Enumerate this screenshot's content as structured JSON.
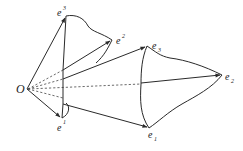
{
  "diagram": {
    "type": "vector-basis-frame",
    "colors": {
      "ink": "#2a2a2a",
      "background": "#ffffff"
    },
    "origin": {
      "label": "O",
      "x": 27,
      "y": 89
    },
    "labels": {
      "O": "O",
      "e_sup1_base": "e",
      "e_sup1_sup": "1",
      "e_sup2_base": "e",
      "e_sup2_sup": "2",
      "e_sup3_base": "e",
      "e_sup3_sup": "3",
      "e_sub1_base": "e",
      "e_sub1_sub": "1",
      "e_sub2_base": "e",
      "e_sub2_sub": "2",
      "e_sub3_base": "e",
      "e_sub3_sub": "3"
    },
    "points": {
      "e_sup3": [
        66,
        16
      ],
      "e_sup2": [
        112,
        40
      ],
      "e_sup1": [
        62,
        118
      ],
      "e_sub3": [
        147,
        46
      ],
      "e_sub2": [
        222,
        75
      ],
      "e_sub1": [
        149,
        128
      ]
    },
    "solid_arrows": [
      "O->e_sup3",
      "O->e_sup1",
      "mid->e_sup2",
      "mid->e_sub3",
      "mid->e_sub2",
      "mid->e_sub1"
    ],
    "dashed_lines": 4
  }
}
